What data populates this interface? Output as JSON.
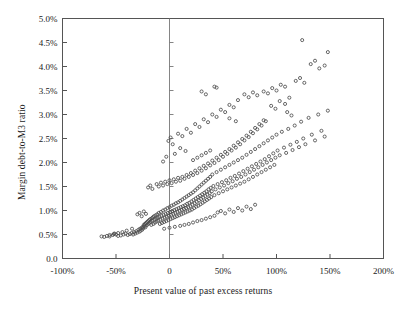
{
  "chart_data": {
    "type": "scatter",
    "title": "",
    "xlabel": "Present value of past excess returns",
    "ylabel": "Margin debt-to-M3 ratio",
    "xlim": [
      -100,
      200
    ],
    "ylim": [
      0,
      5
    ],
    "grid": false,
    "legend": null,
    "xtick_labels": [
      "-100%",
      "-50%",
      "0",
      "50%",
      "100%",
      "150%",
      "200%"
    ],
    "xtick_values": [
      -100,
      -50,
      0,
      50,
      100,
      150,
      200
    ],
    "ytick_labels": [
      "0.0",
      "0.5%",
      "1.0%",
      "1.5%",
      "2.0%",
      "2.5%",
      "3.0%",
      "3.5%",
      "4.0%",
      "4.5%",
      "5.0%"
    ],
    "ytick_values": [
      0,
      0.5,
      1.0,
      1.5,
      2.0,
      2.5,
      3.0,
      3.5,
      4.0,
      4.5,
      5.0
    ],
    "marker": "open-circle",
    "marker_color": "#4d4d4d",
    "marker_size": 3.1,
    "zero_line_x": 0,
    "points": [
      [
        -63.5,
        0.46
      ],
      [
        -61.0,
        0.45
      ],
      [
        -58.5,
        0.47
      ],
      [
        -56.0,
        0.46
      ],
      [
        -53.0,
        0.49
      ],
      [
        -51.5,
        0.52
      ],
      [
        -50.0,
        0.5
      ],
      [
        -48.0,
        0.47
      ],
      [
        -45.5,
        0.48
      ],
      [
        -43.0,
        0.5
      ],
      [
        -41.0,
        0.52
      ],
      [
        -39.0,
        0.49
      ],
      [
        -37.0,
        0.51
      ],
      [
        -35.5,
        0.53
      ],
      [
        -34.0,
        0.5
      ],
      [
        -33.0,
        0.55
      ],
      [
        -32.0,
        0.52
      ],
      [
        -31.0,
        0.57
      ],
      [
        -30.0,
        0.54
      ],
      [
        -29.0,
        0.6
      ],
      [
        -28.0,
        0.56
      ],
      [
        -27.5,
        0.62
      ],
      [
        -27.0,
        0.58
      ],
      [
        -26.0,
        0.64
      ],
      [
        -25.5,
        0.6
      ],
      [
        -25.0,
        0.66
      ],
      [
        -24.5,
        0.63
      ],
      [
        -24.0,
        0.7
      ],
      [
        -23.5,
        0.67
      ],
      [
        -23.0,
        0.72
      ],
      [
        -22.5,
        0.65
      ],
      [
        -22.0,
        0.74
      ],
      [
        -21.5,
        0.69
      ],
      [
        -21.0,
        0.76
      ],
      [
        -20.5,
        0.71
      ],
      [
        -20.0,
        0.78
      ],
      [
        -19.5,
        0.73
      ],
      [
        -19.0,
        0.8
      ],
      [
        -18.5,
        0.75
      ],
      [
        -18.0,
        0.82
      ],
      [
        -17.5,
        0.77
      ],
      [
        -17.0,
        0.7
      ],
      [
        -16.5,
        0.84
      ],
      [
        -16.0,
        0.79
      ],
      [
        -15.5,
        0.86
      ],
      [
        -15.0,
        0.72
      ],
      [
        -14.5,
        0.88
      ],
      [
        -14.0,
        0.81
      ],
      [
        -13.5,
        0.75
      ],
      [
        -13.0,
        0.9
      ],
      [
        -12.5,
        0.83
      ],
      [
        -12.0,
        0.77
      ],
      [
        -11.5,
        0.92
      ],
      [
        -11.0,
        0.85
      ],
      [
        -10.5,
        0.79
      ],
      [
        -10.0,
        0.95
      ],
      [
        -9.5,
        0.87
      ],
      [
        -9.0,
        0.72
      ],
      [
        -8.5,
        0.81
      ],
      [
        -8.0,
        0.97
      ],
      [
        -7.5,
        0.89
      ],
      [
        -7.0,
        0.74
      ],
      [
        -6.5,
        0.83
      ],
      [
        -6.0,
        1.0
      ],
      [
        -5.5,
        0.91
      ],
      [
        -5.0,
        0.76
      ],
      [
        -4.5,
        0.85
      ],
      [
        -4.0,
        1.02
      ],
      [
        -3.5,
        0.93
      ],
      [
        -3.0,
        0.78
      ],
      [
        -2.5,
        0.87
      ],
      [
        -2.0,
        1.05
      ],
      [
        -1.5,
        0.95
      ],
      [
        -1.0,
        0.8
      ],
      [
        -0.5,
        0.89
      ],
      [
        0.0,
        1.07
      ],
      [
        0.5,
        0.97
      ],
      [
        1.0,
        0.82
      ],
      [
        1.5,
        0.91
      ],
      [
        2.0,
        1.1
      ],
      [
        2.5,
        0.99
      ],
      [
        3.0,
        0.84
      ],
      [
        3.5,
        0.93
      ],
      [
        4.0,
        1.12
      ],
      [
        4.5,
        1.01
      ],
      [
        5.0,
        0.86
      ],
      [
        5.5,
        0.95
      ],
      [
        6.0,
        1.15
      ],
      [
        6.5,
        1.03
      ],
      [
        7.0,
        0.88
      ],
      [
        7.5,
        0.97
      ],
      [
        8.0,
        1.17
      ],
      [
        8.5,
        1.05
      ],
      [
        9.0,
        0.9
      ],
      [
        9.5,
        0.99
      ],
      [
        10.0,
        1.2
      ],
      [
        10.5,
        1.07
      ],
      [
        11.0,
        0.92
      ],
      [
        11.5,
        1.01
      ],
      [
        12.0,
        1.23
      ],
      [
        12.5,
        1.09
      ],
      [
        13.0,
        0.94
      ],
      [
        13.5,
        1.03
      ],
      [
        14.0,
        1.26
      ],
      [
        14.5,
        1.11
      ],
      [
        15.0,
        0.96
      ],
      [
        15.5,
        1.05
      ],
      [
        16.0,
        1.29
      ],
      [
        16.5,
        1.14
      ],
      [
        17.0,
        0.98
      ],
      [
        17.5,
        1.07
      ],
      [
        18.0,
        1.32
      ],
      [
        18.5,
        1.16
      ],
      [
        19.0,
        1.0
      ],
      [
        19.5,
        1.09
      ],
      [
        20.0,
        1.35
      ],
      [
        20.5,
        1.19
      ],
      [
        21.0,
        1.02
      ],
      [
        21.5,
        1.12
      ],
      [
        22.0,
        1.38
      ],
      [
        22.5,
        1.22
      ],
      [
        23.0,
        1.05
      ],
      [
        23.5,
        1.15
      ],
      [
        24.0,
        1.42
      ],
      [
        24.5,
        1.25
      ],
      [
        25.0,
        1.08
      ],
      [
        25.5,
        1.18
      ],
      [
        26.0,
        1.46
      ],
      [
        26.5,
        1.28
      ],
      [
        27.0,
        1.1
      ],
      [
        27.5,
        1.21
      ],
      [
        28.0,
        1.5
      ],
      [
        28.5,
        1.31
      ],
      [
        29.0,
        1.13
      ],
      [
        29.5,
        1.24
      ],
      [
        30.0,
        1.54
      ],
      [
        30.5,
        1.34
      ],
      [
        31.0,
        1.16
      ],
      [
        31.5,
        1.27
      ],
      [
        32.0,
        1.58
      ],
      [
        32.5,
        1.37
      ],
      [
        33.0,
        1.19
      ],
      [
        33.5,
        1.3
      ],
      [
        34.0,
        1.62
      ],
      [
        34.5,
        1.4
      ],
      [
        35.0,
        1.22
      ],
      [
        35.5,
        1.33
      ],
      [
        36.0,
        1.66
      ],
      [
        36.5,
        1.44
      ],
      [
        37.0,
        1.25
      ],
      [
        37.5,
        1.36
      ],
      [
        38.0,
        1.7
      ],
      [
        38.5,
        1.47
      ],
      [
        39.0,
        1.28
      ],
      [
        39.5,
        1.4
      ],
      [
        40.0,
        1.75
      ],
      [
        41.0,
        1.51
      ],
      [
        42.0,
        1.32
      ],
      [
        43.0,
        1.44
      ],
      [
        44.0,
        1.8
      ],
      [
        45.0,
        1.55
      ],
      [
        46.0,
        1.36
      ],
      [
        47.0,
        1.48
      ],
      [
        48.0,
        1.85
      ],
      [
        49.0,
        1.59
      ],
      [
        50.0,
        1.4
      ],
      [
        51.0,
        1.52
      ],
      [
        52.0,
        1.9
      ],
      [
        53.0,
        1.63
      ],
      [
        54.0,
        1.44
      ],
      [
        55.0,
        1.57
      ],
      [
        56.0,
        1.95
      ],
      [
        57.0,
        1.68
      ],
      [
        58.0,
        1.48
      ],
      [
        59.0,
        1.61
      ],
      [
        60.0,
        2.0
      ],
      [
        61.0,
        1.72
      ],
      [
        62.0,
        1.52
      ],
      [
        63.0,
        1.66
      ],
      [
        64.0,
        2.05
      ],
      [
        65.0,
        1.77
      ],
      [
        66.0,
        1.56
      ],
      [
        67.0,
        1.7
      ],
      [
        68.0,
        2.1
      ],
      [
        69.0,
        1.82
      ],
      [
        70.0,
        1.6
      ],
      [
        71.0,
        1.75
      ],
      [
        72.0,
        2.16
      ],
      [
        73.0,
        1.87
      ],
      [
        74.0,
        1.65
      ],
      [
        75.0,
        1.8
      ],
      [
        76.0,
        2.22
      ],
      [
        77.0,
        1.92
      ],
      [
        78.0,
        1.7
      ],
      [
        79.0,
        1.85
      ],
      [
        80.0,
        2.28
      ],
      [
        81.0,
        1.97
      ],
      [
        82.0,
        1.75
      ],
      [
        83.0,
        1.9
      ],
      [
        84.0,
        2.34
      ],
      [
        85.0,
        2.02
      ],
      [
        86.0,
        1.8
      ],
      [
        87.0,
        1.95
      ],
      [
        88.0,
        2.4
      ],
      [
        89.0,
        2.07
      ],
      [
        90.0,
        1.85
      ],
      [
        91.0,
        2.0
      ],
      [
        92.0,
        2.46
      ],
      [
        93.0,
        2.13
      ],
      [
        94.0,
        1.9
      ],
      [
        95.0,
        2.05
      ],
      [
        96.0,
        2.52
      ],
      [
        97.0,
        2.19
      ],
      [
        98.0,
        1.95
      ],
      [
        99.0,
        2.1
      ],
      [
        100.0,
        2.58
      ],
      [
        101.0,
        2.25
      ],
      [
        103.0,
        2.15
      ],
      [
        105.0,
        2.64
      ],
      [
        107.0,
        2.31
      ],
      [
        109.0,
        2.2
      ],
      [
        111.0,
        2.7
      ],
      [
        113.0,
        2.37
      ],
      [
        115.0,
        2.26
      ],
      [
        117.0,
        2.77
      ],
      [
        119.0,
        2.43
      ],
      [
        121.0,
        2.32
      ],
      [
        123.0,
        2.85
      ],
      [
        125.0,
        2.5
      ],
      [
        127.0,
        2.38
      ],
      [
        130.0,
        2.93
      ],
      [
        133.0,
        2.58
      ],
      [
        136.0,
        2.46
      ],
      [
        139.0,
        3.0
      ],
      [
        142.0,
        2.66
      ],
      [
        145.0,
        2.54
      ],
      [
        148.0,
        3.08
      ],
      [
        -20.0,
        1.48
      ],
      [
        -18.0,
        1.52
      ],
      [
        -16.0,
        1.45
      ],
      [
        -12.0,
        1.55
      ],
      [
        -10.0,
        1.5
      ],
      [
        -8.0,
        1.58
      ],
      [
        -6.0,
        1.52
      ],
      [
        -4.0,
        1.6
      ],
      [
        -2.0,
        1.55
      ],
      [
        0.0,
        1.63
      ],
      [
        2.0,
        1.57
      ],
      [
        4.0,
        1.65
      ],
      [
        6.0,
        1.6
      ],
      [
        8.0,
        1.68
      ],
      [
        10.0,
        1.62
      ],
      [
        12.0,
        1.7
      ],
      [
        14.0,
        1.66
      ],
      [
        16.0,
        1.74
      ],
      [
        18.0,
        1.7
      ],
      [
        20.0,
        1.78
      ],
      [
        22.0,
        1.74
      ],
      [
        24.0,
        1.83
      ],
      [
        26.0,
        1.78
      ],
      [
        28.0,
        1.88
      ],
      [
        30.0,
        1.83
      ],
      [
        32.0,
        1.93
      ],
      [
        34.0,
        1.88
      ],
      [
        36.0,
        1.98
      ],
      [
        38.0,
        1.94
      ],
      [
        40.0,
        2.04
      ],
      [
        42.0,
        1.99
      ],
      [
        44.0,
        2.1
      ],
      [
        46.0,
        2.05
      ],
      [
        48.0,
        2.16
      ],
      [
        50.0,
        2.12
      ],
      [
        52.0,
        2.22
      ],
      [
        54.0,
        2.18
      ],
      [
        56.0,
        2.28
      ],
      [
        58.0,
        2.25
      ],
      [
        60.0,
        2.35
      ],
      [
        62.0,
        2.31
      ],
      [
        64.0,
        2.42
      ],
      [
        66.0,
        2.38
      ],
      [
        68.0,
        2.49
      ],
      [
        70.0,
        2.46
      ],
      [
        72.0,
        2.56
      ],
      [
        74.0,
        2.53
      ],
      [
        76.0,
        2.64
      ],
      [
        78.0,
        2.61
      ],
      [
        80.0,
        2.72
      ],
      [
        82.0,
        2.69
      ],
      [
        84.0,
        2.8
      ],
      [
        86.0,
        2.77
      ],
      [
        88.0,
        2.88
      ],
      [
        90.0,
        2.86
      ],
      [
        -1.0,
        2.45
      ],
      [
        1.0,
        2.52
      ],
      [
        3.0,
        2.38
      ],
      [
        8.0,
        2.6
      ],
      [
        12.0,
        2.55
      ],
      [
        16.0,
        2.7
      ],
      [
        20.0,
        2.62
      ],
      [
        24.0,
        2.8
      ],
      [
        28.0,
        2.74
      ],
      [
        32.0,
        2.9
      ],
      [
        36.0,
        2.84
      ],
      [
        40.0,
        3.0
      ],
      [
        44.0,
        2.95
      ],
      [
        48.0,
        3.1
      ],
      [
        52.0,
        3.05
      ],
      [
        56.0,
        3.2
      ],
      [
        42.0,
        3.58
      ],
      [
        44.0,
        3.56
      ],
      [
        60.0,
        3.15
      ],
      [
        64.0,
        3.3
      ],
      [
        22.0,
        2.05
      ],
      [
        26.0,
        2.1
      ],
      [
        30.0,
        2.15
      ],
      [
        34.0,
        2.2
      ],
      [
        38.0,
        2.25
      ],
      [
        -6.0,
        2.02
      ],
      [
        -3.0,
        2.12
      ],
      [
        5.0,
        2.18
      ],
      [
        10.0,
        2.3
      ],
      [
        15.0,
        2.24
      ],
      [
        95.0,
        3.18
      ],
      [
        99.0,
        3.12
      ],
      [
        103.0,
        3.28
      ],
      [
        108.0,
        3.22
      ],
      [
        112.0,
        3.35
      ],
      [
        88.0,
        3.48
      ],
      [
        92.0,
        3.44
      ],
      [
        96.0,
        3.55
      ],
      [
        100.0,
        3.5
      ],
      [
        104.0,
        3.62
      ],
      [
        108.0,
        3.58
      ],
      [
        118.0,
        3.7
      ],
      [
        122.0,
        3.76
      ],
      [
        126.0,
        3.66
      ],
      [
        124.0,
        4.55
      ],
      [
        132.0,
        4.05
      ],
      [
        136.0,
        4.12
      ],
      [
        140.0,
        3.96
      ],
      [
        145.0,
        4.02
      ],
      [
        148.0,
        4.3
      ],
      [
        110.0,
        3.05
      ],
      [
        114.0,
        2.98
      ],
      [
        70.0,
        3.42
      ],
      [
        74.0,
        3.36
      ],
      [
        78.0,
        3.46
      ],
      [
        82.0,
        3.4
      ],
      [
        30.0,
        3.48
      ],
      [
        34.0,
        3.42
      ],
      [
        56.0,
        2.92
      ],
      [
        62.0,
        2.86
      ],
      [
        -30.0,
        0.92
      ],
      [
        -28.0,
        0.95
      ],
      [
        -26.0,
        0.88
      ],
      [
        -24.0,
        0.98
      ],
      [
        -22.0,
        0.93
      ],
      [
        -35.0,
        0.62
      ],
      [
        -40.0,
        0.58
      ],
      [
        -44.0,
        0.55
      ],
      [
        -48.0,
        0.53
      ],
      [
        -52.0,
        0.51
      ],
      [
        -56.0,
        0.49
      ],
      [
        45.0,
        0.96
      ],
      [
        48.0,
        0.99
      ],
      [
        52.0,
        0.94
      ],
      [
        56.0,
        1.02
      ],
      [
        60.0,
        0.97
      ],
      [
        64.0,
        1.05
      ],
      [
        68.0,
        1.0
      ],
      [
        72.0,
        1.08
      ],
      [
        76.0,
        1.03
      ],
      [
        80.0,
        1.12
      ],
      [
        10.0,
        0.68
      ],
      [
        14.0,
        0.7
      ],
      [
        18.0,
        0.72
      ],
      [
        22.0,
        0.75
      ],
      [
        26.0,
        0.78
      ],
      [
        30.0,
        0.8
      ],
      [
        34.0,
        0.83
      ],
      [
        38.0,
        0.86
      ],
      [
        42.0,
        0.89
      ],
      [
        5.0,
        0.66
      ],
      [
        0.0,
        0.64
      ],
      [
        -5.0,
        0.62
      ]
    ]
  }
}
